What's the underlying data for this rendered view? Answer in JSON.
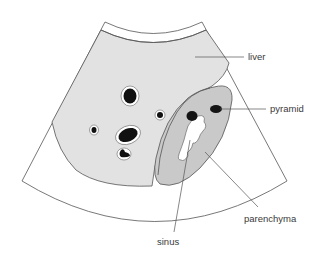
{
  "diagram": {
    "colors": {
      "background": "#ffffff",
      "liver": "#e2e2e2",
      "kidney_parenchyma": "#c9c9c9",
      "pyramid": "#141414",
      "sinus": "#ffffff",
      "vessel": "#111111",
      "outline": "#555555"
    },
    "labels": {
      "liver": "liver",
      "pyramid": "pyramid",
      "parenchyma": "parenchyma",
      "sinus": "sinus"
    }
  }
}
